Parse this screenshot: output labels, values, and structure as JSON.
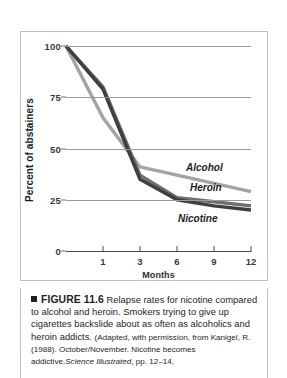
{
  "chart_data": {
    "type": "line",
    "title": "",
    "xlabel": "Months",
    "ylabel": "Percent of abstainers",
    "x": [
      0,
      1,
      3,
      6,
      9,
      12
    ],
    "categories": [
      "0",
      "1",
      "3",
      "6",
      "9",
      "12"
    ],
    "xtick_labels": [
      "1",
      "3",
      "6",
      "9",
      "12"
    ],
    "ytick_labels": [
      "0",
      "25",
      "50",
      "75",
      "100"
    ],
    "ylim": [
      0,
      100
    ],
    "grid": "horizontal",
    "legend_position": "inline-right",
    "series": [
      {
        "name": "Alcohol",
        "color": "#a3a3a3",
        "values": [
          100,
          65,
          41,
          37,
          33,
          29
        ]
      },
      {
        "name": "Heroin",
        "color": "#6e6e6e",
        "values": [
          100,
          80,
          37,
          26,
          24,
          22
        ]
      },
      {
        "name": "Nicotine",
        "color": "#3f3f3f",
        "values": [
          100,
          79,
          35,
          25,
          22,
          20
        ]
      }
    ]
  },
  "axes": {
    "y_title": "Percent of abstainers",
    "x_title": "Months",
    "y_ticks": [
      {
        "label": "100",
        "value": 100
      },
      {
        "label": "75",
        "value": 75
      },
      {
        "label": "50",
        "value": 50
      },
      {
        "label": "25",
        "value": 25
      },
      {
        "label": "0",
        "value": 0
      }
    ],
    "x_ticks": [
      {
        "label": "1",
        "index": 1
      },
      {
        "label": "3",
        "index": 2
      },
      {
        "label": "6",
        "index": 3
      },
      {
        "label": "9",
        "index": 4
      },
      {
        "label": "12",
        "index": 5
      }
    ]
  },
  "caption": {
    "figure_label": "FIGURE 11.6",
    "main_text": "Relapse rates for nicotine compared to alcohol and heroin. Smokers trying to give up cigarettes backslide about as often as alcoholics and heroin addicts.",
    "source_lead": "(Adapted, with permission, from Kanigel, R. (1988). October/November. Nicotine becomes addictive.",
    "source_italic": "Science Illustrated",
    "source_tail": ", pp. 12–14,"
  }
}
